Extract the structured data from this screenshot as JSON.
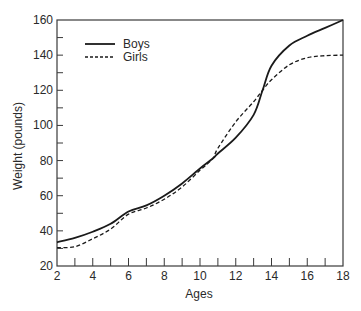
{
  "chart_data": {
    "type": "line",
    "title": "",
    "xlabel": "Ages",
    "ylabel": "Weight (pounds)",
    "xlim": [
      2,
      18
    ],
    "ylim": [
      20,
      160
    ],
    "xticks": [
      2,
      4,
      6,
      8,
      10,
      12,
      14,
      16,
      18
    ],
    "xminor": [
      3,
      5,
      7,
      9,
      11,
      13,
      15,
      17
    ],
    "yticks": [
      20,
      40,
      60,
      80,
      100,
      120,
      140,
      160
    ],
    "yminor": [
      30,
      50,
      70,
      90,
      110,
      130,
      150
    ],
    "grid": false,
    "legend_position": "upper-left",
    "x": [
      2,
      3,
      4,
      5,
      6,
      7,
      8,
      9,
      10,
      10.7,
      11,
      12,
      13,
      13.5,
      14,
      15,
      16,
      17,
      18
    ],
    "series": [
      {
        "name": "Boys",
        "style": "solid",
        "color": "#1a1a1a",
        "values": [
          33.5,
          36,
          39.5,
          44,
          51,
          54.5,
          60,
          67,
          75.5,
          81,
          84,
          93,
          106,
          120,
          134,
          145.5,
          151,
          155.5,
          160
        ]
      },
      {
        "name": "Girls",
        "style": "dashed",
        "color": "#1a1a1a",
        "values": [
          30.5,
          31,
          35.5,
          41,
          49.5,
          53,
          58,
          65,
          74.5,
          81,
          87,
          102,
          113.5,
          120,
          126,
          134.5,
          138.5,
          139.7,
          140
        ]
      }
    ]
  }
}
